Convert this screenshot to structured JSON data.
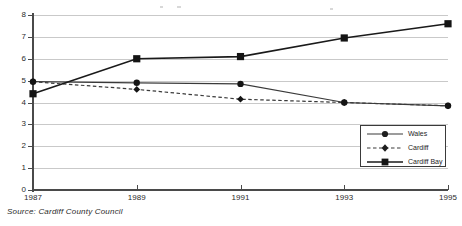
{
  "chart_data": {
    "type": "line",
    "title": "",
    "xlabel": "",
    "ylabel": "",
    "categories": [
      "1987",
      "1989",
      "1991",
      "1993",
      "1995"
    ],
    "x_tick_labels": [
      "1987",
      "1989",
      "1991",
      "1993",
      "1995"
    ],
    "y_tick_labels": [
      "0",
      "1",
      "2",
      "3",
      "4",
      "5",
      "6",
      "7",
      "8"
    ],
    "ylim": [
      0,
      8
    ],
    "grid": "horizontal",
    "legend_position": "bottom-right",
    "series": [
      {
        "name": "Wales",
        "marker": "circle",
        "line_style": "solid",
        "values": [
          4.95,
          4.9,
          4.85,
          4.0,
          3.85
        ]
      },
      {
        "name": "Cardiff",
        "marker": "diamond",
        "line_style": "dashed",
        "values": [
          4.95,
          4.6,
          4.15,
          4.0,
          3.85
        ]
      },
      {
        "name": "Cardiff Bay",
        "marker": "square",
        "line_style": "solid",
        "values": [
          4.4,
          6.0,
          6.1,
          6.95,
          7.6
        ]
      }
    ]
  },
  "legend": {
    "entries": [
      {
        "label": "Wales"
      },
      {
        "label": "Cardiff"
      },
      {
        "label": "Cardiff Bay"
      }
    ]
  },
  "caption": {
    "source": "Source: Cardiff County Council"
  },
  "colors": {
    "axis": "#4a4a4a",
    "grid": "#c9c9c9",
    "series_wales": "#3a3a3a",
    "series_cardiff": "#3a3a3a",
    "series_cardiff_bay": "#1a1a1a",
    "text": "#2b2b2b",
    "background": "#ffffff"
  }
}
